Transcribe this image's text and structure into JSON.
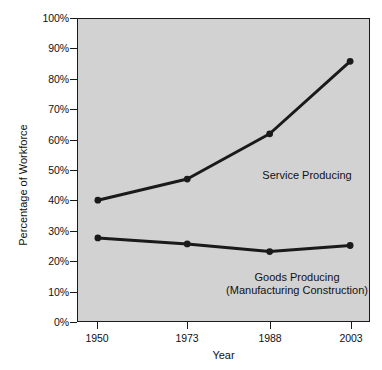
{
  "chart_data": {
    "type": "line",
    "title": "",
    "xlabel": "Year",
    "ylabel": "Percentage of Workforce",
    "categories": [
      "1950",
      "1973",
      "1988",
      "2003"
    ],
    "x": [
      1950,
      1973,
      1988,
      2003
    ],
    "xtick_labels": [
      "1950",
      "1973",
      "1988",
      "2003"
    ],
    "ytick_labels": [
      "0%",
      "10%",
      "20%",
      "30%",
      "40%",
      "50%",
      "60%",
      "70%",
      "80%",
      "90%",
      "100%"
    ],
    "ytick_values": [
      0,
      10,
      20,
      30,
      40,
      50,
      60,
      70,
      80,
      90,
      100
    ],
    "ylim": [
      0,
      100
    ],
    "grid": false,
    "legend": "inline-annotations",
    "plot_background": "#d2d2d2",
    "line_color": "#1a1a1a",
    "series": [
      {
        "name": "Service Producing",
        "label_line1": "Service Producing",
        "label_line2": "",
        "values": [
          40,
          47,
          62,
          86
        ],
        "marker": "circle"
      },
      {
        "name": "Goods Producing",
        "label_line1": "Goods Producing",
        "label_line2": "(Manufacturing Construction)",
        "values": [
          27.5,
          25.5,
          23,
          25
        ],
        "marker": "circle"
      }
    ],
    "annotations": [
      {
        "text": "Service Producing",
        "x": 1983,
        "y": 52
      },
      {
        "text": "Goods Producing",
        "x": 1980,
        "y": 20
      },
      {
        "text": "(Manufacturing Construction)",
        "x": 1980,
        "y": 16
      }
    ]
  }
}
